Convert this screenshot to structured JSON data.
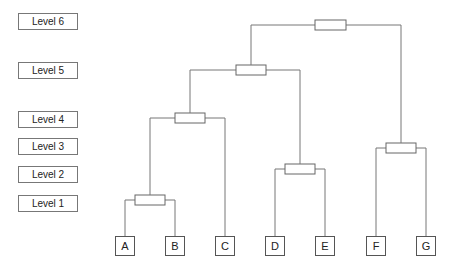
{
  "levels": [
    "Level 6",
    "Level 5",
    "Level 4",
    "Level 3",
    "Level 2",
    "Level 1"
  ],
  "leaves": [
    "A",
    "B",
    "C",
    "D",
    "E",
    "F",
    "G"
  ],
  "merges": [
    {
      "name": "merge-AB",
      "children": [
        "A",
        "B"
      ],
      "level": "Level 1"
    },
    {
      "name": "merge-DE",
      "children": [
        "D",
        "E"
      ],
      "level": "Level 2"
    },
    {
      "name": "merge-FG",
      "children": [
        "F",
        "G"
      ],
      "level": "Level 3"
    },
    {
      "name": "merge-AB-C",
      "children": [
        "AB",
        "C"
      ],
      "level": "Level 4"
    },
    {
      "name": "merge-ABC-DE",
      "children": [
        "ABC",
        "DE"
      ],
      "level": "Level 5"
    },
    {
      "name": "merge-ABCDE-FG",
      "children": [
        "ABCDE",
        "FG"
      ],
      "level": "Level 6"
    }
  ]
}
